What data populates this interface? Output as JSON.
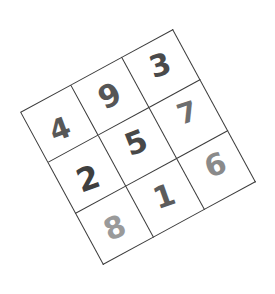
{
  "image": {
    "kind": "handwritten-digit-grid",
    "description": "Rotated 3 by 3 square grid containing nine handwritten digits",
    "width": 275,
    "height": 294,
    "background_color": "#ffffff",
    "grid_line_color": "#3b3b3b",
    "rotation_degrees": -28.5
  },
  "grid": {
    "rows": 3,
    "columns": 3,
    "cells": [
      {
        "row": 0,
        "col": 0,
        "value": "4",
        "color": "#585858"
      },
      {
        "row": 0,
        "col": 1,
        "value": "9",
        "color": "#565656"
      },
      {
        "row": 0,
        "col": 2,
        "value": "3",
        "color": "#4a4a4a"
      },
      {
        "row": 1,
        "col": 0,
        "value": "2",
        "color": "#3f3f3f"
      },
      {
        "row": 1,
        "col": 1,
        "value": "5",
        "color": "#484848"
      },
      {
        "row": 1,
        "col": 2,
        "value": "7",
        "color": "#6e6e6e"
      },
      {
        "row": 2,
        "col": 0,
        "value": "8",
        "color": "#9a9a9a"
      },
      {
        "row": 2,
        "col": 1,
        "value": "1",
        "color": "#5c5c5c"
      },
      {
        "row": 2,
        "col": 2,
        "value": "6",
        "color": "#8a8a8a"
      }
    ],
    "rows_text": [
      [
        "4",
        "9",
        "3"
      ],
      [
        "2",
        "5",
        "7"
      ],
      [
        "8",
        "1",
        "6"
      ]
    ]
  },
  "chart_data": {
    "type": "table",
    "title": "",
    "categories": [
      "col-1",
      "col-2",
      "col-3"
    ],
    "series": [
      {
        "name": "row-1",
        "values": [
          4,
          9,
          3
        ]
      },
      {
        "name": "row-2",
        "values": [
          2,
          5,
          7
        ]
      },
      {
        "name": "row-3",
        "values": [
          8,
          1,
          6
        ]
      }
    ],
    "row_sums": [
      16,
      14,
      15
    ],
    "column_sums": [
      14,
      15,
      16
    ],
    "diagonal_sums": [
      15,
      15
    ]
  }
}
